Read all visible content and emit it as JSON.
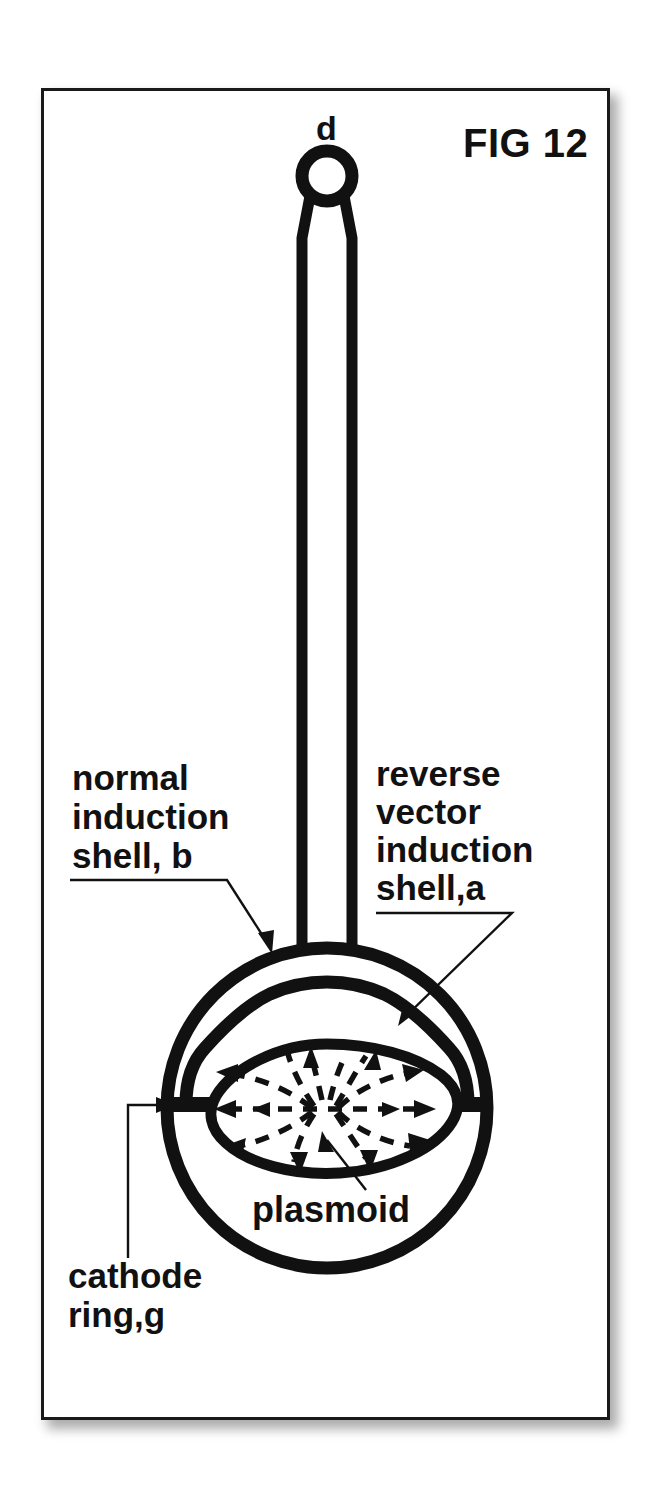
{
  "figure": {
    "title": "FIG 12",
    "terminal_label": "d",
    "labels": {
      "normal_shell": "normal\ninduction\nshell, b",
      "normal_shell_lines": [
        "normal",
        "induction",
        "shell, b"
      ],
      "reverse_shell": "reverse\nvector\ninduction\nshell,a",
      "reverse_shell_lines": [
        "reverse",
        "vector",
        "induction",
        "shell,a"
      ],
      "cathode": "cathode\nring,g",
      "cathode_lines": [
        "cathode",
        "ring,g"
      ],
      "plasmoid": "plasmoid"
    },
    "colors": {
      "ink": "#111111",
      "frame": "#1a1a1a",
      "background": "#ffffff"
    },
    "components": [
      {
        "id": "d",
        "name": "terminal electrode",
        "label": "d"
      },
      {
        "id": "a",
        "name": "reverse vector induction shell",
        "label": "shell,a"
      },
      {
        "id": "b",
        "name": "normal induction shell",
        "label": "shell, b"
      },
      {
        "id": "g",
        "name": "cathode ring",
        "label": "ring,g"
      },
      {
        "id": "plasmoid",
        "name": "plasmoid",
        "label": "plasmoid"
      }
    ]
  }
}
